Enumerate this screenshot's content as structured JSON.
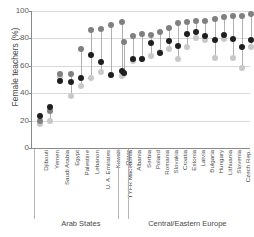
{
  "chart_data": {
    "type": "scatter",
    "title": "",
    "xlabel": "",
    "ylabel": "Female teachers (%)",
    "ylim": [
      0,
      100
    ],
    "yticks": [
      0,
      20,
      40,
      60,
      80,
      100
    ],
    "grid": true,
    "legend_position": "none",
    "groups": [
      {
        "label": "Arab States",
        "categories": [
          "Djibouti",
          "Yemen",
          "Saudi Arabia",
          "Egypt",
          "Palestine",
          "Lebanon",
          "U. A. Emirates",
          "Kuwait",
          "Qatar"
        ]
      },
      {
        "label": "Central/Eastern Europe",
        "categories": [
          "TYFR Macedonia",
          "Albania",
          "Serbia",
          "Poland",
          "Romania",
          "Slovakia",
          "Croatia",
          "Estonia",
          "Latvia",
          "Bulgaria",
          "Hungary",
          "Lithuania",
          "Slovenia",
          "Czech Rep.",
          "Rep. Moldova"
        ]
      }
    ],
    "categories": [
      "Djibouti",
      "Yemen",
      "Saudi Arabia",
      "Egypt",
      "Palestine",
      "Lebanon",
      "U. A. Emirates",
      "Kuwait",
      "Qatar",
      "TYFR Macedonia",
      "Albania",
      "Serbia",
      "Poland",
      "Romania",
      "Slovakia",
      "Croatia",
      "Estonia",
      "Latvia",
      "Bulgaria",
      "Hungary",
      "Lithuania",
      "Slovenia",
      "Czech Rep.",
      "Rep. Moldova"
    ],
    "series": [
      {
        "name": "dark",
        "color": "#1f1f1f",
        "values": [
          23.5,
          30.0,
          49.0,
          48.5,
          51.0,
          68.0,
          62.5,
          53.0,
          56.5,
          55.0,
          65.0,
          65.0,
          76.5,
          69.5,
          78.0,
          74.5,
          83.5,
          85.0,
          82.0,
          79.0,
          82.5,
          79.5,
          74.0,
          78.5
        ]
      },
      {
        "name": "medium",
        "color": "#808080",
        "values": [
          20.0,
          27.0,
          54.0,
          54.0,
          72.0,
          86.0,
          86.5,
          90.0,
          92.0,
          77.5,
          82.0,
          83.0,
          82.5,
          84.5,
          87.5,
          91.5,
          92.0,
          92.5,
          92.5,
          94.5,
          95.5,
          96.0,
          96.5,
          97.5
        ]
      },
      {
        "name": "light",
        "color": "#c8c8c8",
        "values": [
          17.5,
          20.0,
          52.0,
          38.0,
          45.5,
          51.0,
          55.5,
          53.5,
          52.5,
          54.0,
          63.5,
          65.0,
          67.5,
          70.0,
          72.5,
          65.0,
          74.0,
          80.5,
          78.5,
          66.0,
          79.5,
          66.0,
          58.5,
          73.5
        ]
      }
    ]
  }
}
